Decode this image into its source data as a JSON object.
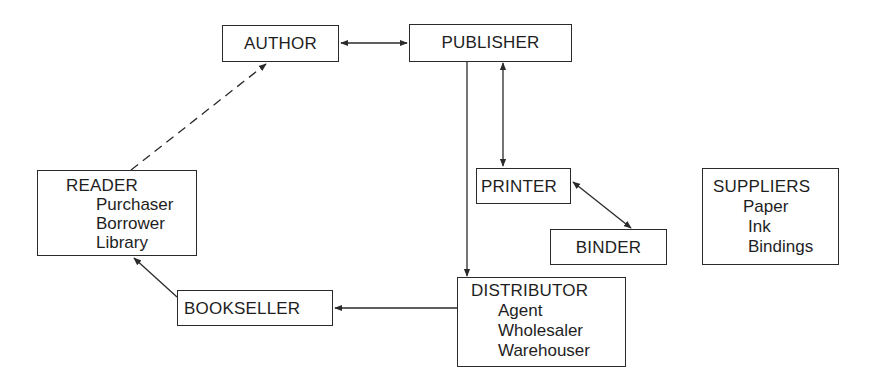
{
  "diagram": {
    "type": "book-trade-flow",
    "nodes": {
      "author": {
        "label": "AUTHOR"
      },
      "publisher": {
        "label": "PUBLISHER"
      },
      "printer": {
        "label": "PRINTER"
      },
      "binder": {
        "label": "BINDER"
      },
      "reader": {
        "label": "READER",
        "items": [
          "Purchaser",
          "Borrower",
          "Library"
        ]
      },
      "bookseller": {
        "label": "BOOKSELLER"
      },
      "distributor": {
        "label": "DISTRIBUTOR",
        "items": [
          "Agent",
          "Wholesaler",
          "Warehouser"
        ]
      },
      "suppliers": {
        "label": "SUPPLIERS",
        "items": [
          "Paper",
          "Ink",
          "Bindings"
        ]
      }
    },
    "edges": [
      {
        "from": "author",
        "to": "publisher",
        "direction": "both",
        "style": "solid"
      },
      {
        "from": "publisher",
        "to": "printer",
        "direction": "both",
        "style": "solid"
      },
      {
        "from": "printer",
        "to": "binder",
        "direction": "both",
        "style": "solid"
      },
      {
        "from": "publisher",
        "to": "distributor",
        "direction": "forward",
        "style": "solid"
      },
      {
        "from": "distributor",
        "to": "bookseller",
        "direction": "forward",
        "style": "solid"
      },
      {
        "from": "bookseller",
        "to": "reader",
        "direction": "forward",
        "style": "solid"
      },
      {
        "from": "reader",
        "to": "author",
        "direction": "forward",
        "style": "dashed"
      }
    ],
    "colors": {
      "line": "#2a2a2a",
      "background": "#ffffff",
      "text": "#1e1e1e"
    }
  }
}
